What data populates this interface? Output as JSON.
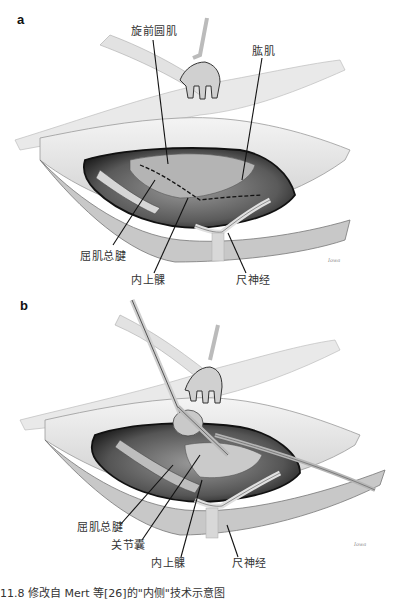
{
  "figure": {
    "caption": "11.8  修改自 Mert 等[26]的\"内侧\"技术示意图",
    "panels": [
      {
        "letter": "a",
        "labels": {
          "pronator_teres": "旋前圆肌",
          "brachialis": "肱肌",
          "common_flexor_tendon": "屈肌总腱",
          "medial_epicondyle": "内上髁",
          "ulnar_nerve": "尺神经"
        },
        "signature": "Iowa"
      },
      {
        "letter": "b",
        "labels": {
          "common_flexor_tendon": "屈肌总腱",
          "joint_capsule": "关节囊",
          "medial_epicondyle": "内上髁",
          "ulnar_nerve": "尺神经"
        },
        "signature": "Iowa"
      }
    ]
  },
  "colors": {
    "skin_light": "#e4e4e4",
    "tissue_mid": "#a9a9a9",
    "cavity_dark": "#3a3a3a",
    "leader_line": "#111111"
  }
}
